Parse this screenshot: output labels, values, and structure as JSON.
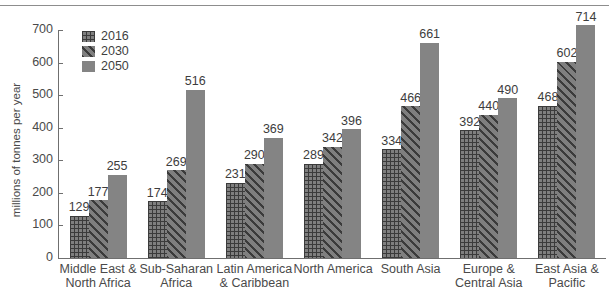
{
  "chart_data": {
    "type": "bar",
    "title": "",
    "subtitle": "",
    "xlabel": "",
    "ylabel": "millions of tonnes per year",
    "ylim": [
      0,
      700
    ],
    "yticks": [
      0,
      100,
      200,
      300,
      400,
      500,
      600,
      700
    ],
    "grid": false,
    "legend_position": "top-left",
    "categories": [
      "Middle East & North Africa",
      "Sub-Saharan Africa",
      "Latin America & Caribbean",
      "North America",
      "South Asia",
      "Europe & Central Asia",
      "East Asia & Pacific"
    ],
    "category_lines": [
      [
        "Middle East &",
        "North Africa"
      ],
      [
        "Sub-Saharan",
        "Africa"
      ],
      [
        "Latin America",
        "& Caribbean"
      ],
      [
        "North America",
        ""
      ],
      [
        "South Asia",
        ""
      ],
      [
        "Europe &",
        "Central Asia"
      ],
      [
        "East Asia &",
        "Pacific"
      ]
    ],
    "series": [
      {
        "name": "2016",
        "pattern": "grid",
        "color": "#7f7f7f",
        "values": [
          129,
          174,
          231,
          289,
          334,
          392,
          468
        ]
      },
      {
        "name": "2030",
        "pattern": "diagonal",
        "color": "#7f7f7f",
        "values": [
          177,
          269,
          290,
          342,
          466,
          440,
          602
        ]
      },
      {
        "name": "2050",
        "pattern": "solid",
        "color": "#848484",
        "values": [
          255,
          516,
          369,
          396,
          661,
          490,
          714
        ]
      }
    ]
  },
  "legend": {
    "items": [
      {
        "label": "2016",
        "pattern": "grid"
      },
      {
        "label": "2030",
        "pattern": "diagonal"
      },
      {
        "label": "2050",
        "pattern": "solid"
      }
    ]
  },
  "axis": {
    "y_title": "millions of tonnes per year",
    "y_tick_labels": [
      "0",
      "100",
      "200",
      "300",
      "400",
      "500",
      "600",
      "700"
    ]
  },
  "colors": {
    "bar_gray": "#7f7f7f",
    "bar_solid": "#848484",
    "hatch_dark": "#3b3b3b",
    "axis": "#6f6f6f",
    "text": "#4a4a4a",
    "background": "#ffffff"
  }
}
